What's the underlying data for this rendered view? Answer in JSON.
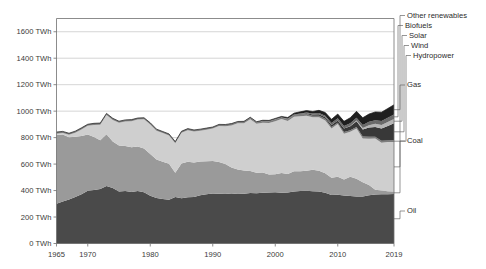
{
  "chart_data": {
    "type": "area",
    "stacked": true,
    "title": "",
    "xlabel": "",
    "ylabel": "",
    "unit": "TWh",
    "grid": true,
    "legend_position": "right-inline-labels",
    "xlim": [
      1965,
      2019
    ],
    "ylim": [
      0,
      1700
    ],
    "y_ticks": [
      0,
      200,
      400,
      600,
      800,
      1000,
      1200,
      1400,
      1600
    ],
    "y_tick_labels": [
      "0 TWh",
      "200 TWh",
      "400 TWh",
      "600 TWh",
      "800 TWh",
      "1000 TWh",
      "1200 TWh",
      "1400 TWh",
      "1600 TWh"
    ],
    "x_ticks": [
      1965,
      1970,
      1980,
      1990,
      2000,
      2010,
      2019
    ],
    "x_tick_labels": [
      "1965",
      "1970",
      "1980",
      "1990",
      "2000",
      "2010",
      "2019"
    ],
    "x": [
      1965,
      1966,
      1967,
      1968,
      1969,
      1970,
      1971,
      1972,
      1973,
      1974,
      1975,
      1976,
      1977,
      1978,
      1979,
      1980,
      1981,
      1982,
      1983,
      1984,
      1985,
      1986,
      1987,
      1988,
      1989,
      1990,
      1991,
      1992,
      1993,
      1994,
      1995,
      1996,
      1997,
      1998,
      1999,
      2000,
      2001,
      2002,
      2003,
      2004,
      2005,
      2006,
      2007,
      2008,
      2009,
      2010,
      2011,
      2012,
      2013,
      2014,
      2015,
      2016,
      2017,
      2018,
      2019
    ],
    "series": [
      {
        "name": "Oil",
        "color": "#4a4a4a",
        "values": [
          300,
          318,
          333,
          352,
          372,
          398,
          404,
          412,
          435,
          420,
          392,
          396,
          390,
          396,
          388,
          360,
          344,
          336,
          330,
          352,
          342,
          350,
          352,
          364,
          372,
          378,
          376,
          378,
          374,
          378,
          376,
          382,
          380,
          384,
          386,
          388,
          384,
          386,
          392,
          396,
          398,
          394,
          392,
          384,
          366,
          368,
          362,
          358,
          356,
          356,
          364,
          370,
          372,
          372,
          374
        ]
      },
      {
        "name": "Coal",
        "color": "#9a9a9a",
        "values": [
          520,
          505,
          470,
          455,
          440,
          425,
          400,
          368,
          390,
          350,
          348,
          340,
          338,
          336,
          330,
          316,
          290,
          282,
          272,
          182,
          262,
          268,
          260,
          256,
          250,
          246,
          240,
          222,
          200,
          182,
          176,
          166,
          154,
          152,
          136,
          136,
          148,
          140,
          154,
          150,
          152,
          164,
          158,
          146,
          130,
          136,
          122,
          146,
          134,
          106,
          78,
          36,
          28,
          22,
          18
        ]
      },
      {
        "name": "Gas",
        "color": "#cfcfcf",
        "values": [
          10,
          12,
          18,
          30,
          50,
          66,
          92,
          118,
          146,
          164,
          172,
          186,
          196,
          204,
          220,
          224,
          218,
          216,
          214,
          224,
          232,
          238,
          234,
          232,
          238,
          244,
          272,
          286,
          318,
          348,
          356,
          390,
          370,
          376,
          388,
          400,
          408,
          400,
          412,
          416,
          416,
          396,
          404,
          400,
          372,
          398,
          346,
          340,
          378,
          332,
          350,
          388,
          362,
          372,
          374
        ]
      },
      {
        "name": "Hydropower",
        "color": "#7e7e7e",
        "values": [
          12,
          12,
          12,
          12,
          12,
          12,
          12,
          12,
          12,
          12,
          12,
          12,
          12,
          12,
          12,
          12,
          12,
          12,
          12,
          12,
          12,
          12,
          12,
          12,
          12,
          12,
          12,
          12,
          12,
          12,
          12,
          12,
          12,
          12,
          12,
          12,
          10,
          12,
          10,
          12,
          12,
          12,
          12,
          12,
          12,
          10,
          12,
          12,
          12,
          14,
          14,
          12,
          14,
          12,
          14
        ]
      },
      {
        "name": "Wind",
        "color": "#383838",
        "values": [
          0,
          0,
          0,
          0,
          0,
          0,
          0,
          0,
          0,
          0,
          0,
          0,
          0,
          0,
          0,
          0,
          0,
          0,
          0,
          0,
          0,
          0,
          0,
          0,
          0,
          0,
          0,
          0,
          0,
          0,
          1,
          1,
          1,
          2,
          2,
          2,
          2,
          3,
          3,
          4,
          6,
          8,
          10,
          12,
          16,
          18,
          26,
          30,
          44,
          54,
          70,
          74,
          92,
          110,
          128
        ]
      },
      {
        "name": "Solar",
        "color": "#b5b5b5",
        "values": [
          0,
          0,
          0,
          0,
          0,
          0,
          0,
          0,
          0,
          0,
          0,
          0,
          0,
          0,
          0,
          0,
          0,
          0,
          0,
          0,
          0,
          0,
          0,
          0,
          0,
          0,
          0,
          0,
          0,
          0,
          0,
          0,
          0,
          0,
          0,
          0,
          0,
          0,
          0,
          0,
          0,
          0,
          0,
          0,
          0,
          0,
          1,
          2,
          5,
          10,
          18,
          24,
          28,
          30,
          32
        ]
      },
      {
        "name": "Biofuels",
        "color": "#6a6a6a",
        "values": [
          0,
          0,
          0,
          0,
          0,
          0,
          0,
          0,
          0,
          0,
          0,
          0,
          0,
          0,
          0,
          0,
          0,
          0,
          0,
          0,
          0,
          0,
          0,
          0,
          0,
          0,
          0,
          1,
          1,
          1,
          1,
          1,
          1,
          2,
          2,
          2,
          2,
          3,
          4,
          5,
          6,
          8,
          10,
          12,
          14,
          16,
          18,
          20,
          22,
          24,
          26,
          28,
          30,
          32,
          34
        ]
      },
      {
        "name": "Other renewables",
        "color": "#1f1f1f",
        "values": [
          0,
          0,
          0,
          0,
          0,
          0,
          0,
          0,
          0,
          0,
          0,
          0,
          0,
          0,
          0,
          0,
          0,
          0,
          0,
          0,
          0,
          0,
          0,
          0,
          0,
          0,
          0,
          0,
          1,
          1,
          1,
          2,
          2,
          3,
          4,
          5,
          6,
          8,
          10,
          12,
          14,
          16,
          20,
          24,
          28,
          32,
          36,
          42,
          48,
          54,
          58,
          62,
          66,
          70,
          74
        ]
      }
    ]
  },
  "legend": {
    "items": [
      {
        "label": "Other renewables"
      },
      {
        "label": "Biofuels"
      },
      {
        "label": "Solar"
      },
      {
        "label": "Wind"
      },
      {
        "label": "Hydropower"
      },
      {
        "label": "Gas"
      },
      {
        "label": "Coal"
      },
      {
        "label": "Oil"
      }
    ]
  }
}
